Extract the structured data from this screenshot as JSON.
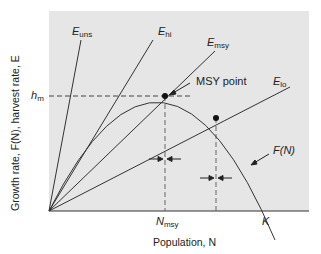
{
  "figure": {
    "colors": {
      "plot_background": "#e6e6e6",
      "line": "#333333",
      "dashed": "#444444",
      "point": "#111111"
    },
    "y_axis_label": "Growth rate, F(N), harvest rate, E",
    "x_axis_label": "Population, N",
    "tick_labels": {
      "h_m": {
        "main": "h",
        "sub": "m"
      },
      "N_msy": {
        "main": "N",
        "sub": "msy"
      },
      "K": "K"
    },
    "lines": [
      {
        "name": "E_uns",
        "main": "E",
        "sub": "uns"
      },
      {
        "name": "E_hi",
        "main": "E",
        "sub": "hi"
      },
      {
        "name": "E_msy",
        "main": "E",
        "sub": "msy"
      },
      {
        "name": "E_lo",
        "main": "E",
        "sub": "lo"
      }
    ],
    "curve_label": "F(N)",
    "annotation": "MSY point"
  }
}
